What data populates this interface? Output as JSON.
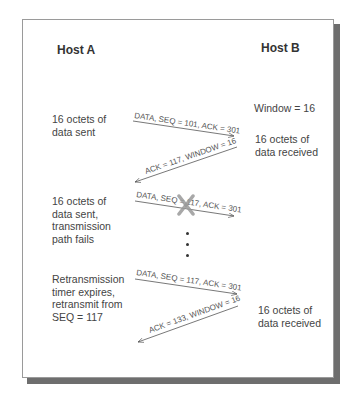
{
  "diagram": {
    "host_a": {
      "title": "Host A"
    },
    "host_b": {
      "title": "Host B"
    },
    "host_a_notes": [
      "16 octets of\ndata sent",
      "16 octets of\ndata sent,\ntransmission\npath fails",
      "Retransmission\ntimer expires,\nretransmit from\nSEQ = 117"
    ],
    "host_b_notes": [
      "Window = 16",
      "16 octets of\ndata received",
      "16 octets of\ndata received"
    ],
    "messages": [
      {
        "label": "DATA, SEQ = 101, ACK = 301",
        "direction": "A-to-B",
        "lost": false
      },
      {
        "label": "ACK = 117, WINDOW = 16",
        "direction": "B-to-A",
        "lost": false
      },
      {
        "label": "DATA, SEQ = 117, ACK = 301",
        "direction": "A-to-B",
        "lost": true
      },
      {
        "label": "DATA, SEQ = 117, ACK = 301",
        "direction": "A-to-B",
        "lost": false
      },
      {
        "label": "ACK = 133, WINDOW = 16",
        "direction": "B-to-A",
        "lost": false
      }
    ],
    "lost_marker": "x-mark",
    "ellipsis": "vertical-dots"
  }
}
